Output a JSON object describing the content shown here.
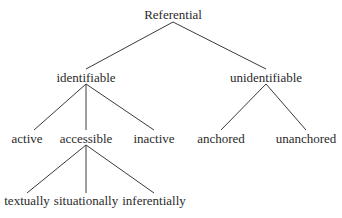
{
  "diagram": {
    "type": "tree",
    "nodes": {
      "root": {
        "label": "Referential",
        "x": 173,
        "y": 14
      },
      "identifiable": {
        "label": "identifiable",
        "x": 86,
        "y": 77
      },
      "unidentifiable": {
        "label": "unidentifiable",
        "x": 266,
        "y": 77
      },
      "active": {
        "label": "active",
        "x": 27,
        "y": 138
      },
      "accessible": {
        "label": "accessible",
        "x": 86,
        "y": 138
      },
      "inactive": {
        "label": "inactive",
        "x": 154,
        "y": 138
      },
      "anchored": {
        "label": "anchored",
        "x": 221,
        "y": 138
      },
      "unanchored": {
        "label": "unanchored",
        "x": 306,
        "y": 138
      },
      "textually": {
        "label": "textually",
        "x": 27,
        "y": 200
      },
      "situationally": {
        "label": "situationally",
        "x": 86,
        "y": 200
      },
      "inferentially": {
        "label": "inferentially",
        "x": 154,
        "y": 200
      }
    },
    "edges": [
      [
        "root",
        "identifiable"
      ],
      [
        "root",
        "unidentifiable"
      ],
      [
        "identifiable",
        "active"
      ],
      [
        "identifiable",
        "accessible"
      ],
      [
        "identifiable",
        "inactive"
      ],
      [
        "unidentifiable",
        "anchored"
      ],
      [
        "unidentifiable",
        "unanchored"
      ],
      [
        "accessible",
        "textually"
      ],
      [
        "accessible",
        "situationally"
      ],
      [
        "accessible",
        "inferentially"
      ]
    ]
  }
}
